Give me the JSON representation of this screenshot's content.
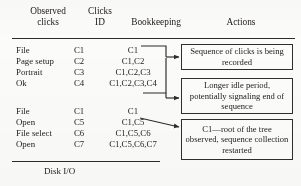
{
  "figure": {
    "caption_columns": {
      "observed_clicks": "Observed\nclicks",
      "clicks_id": "Clicks\nID",
      "bookkeeping": "Bookkeeping",
      "actions": "Actions"
    },
    "footer_label": "Disk I/O"
  },
  "rows": [
    {
      "observed": "File",
      "id": "C1",
      "bookkeeping": "C1"
    },
    {
      "observed": "Page setup",
      "id": "C2",
      "bookkeeping": "C1,C2"
    },
    {
      "observed": "Portrait",
      "id": "C3",
      "bookkeeping": "C1,C2,C3"
    },
    {
      "observed": "Ok",
      "id": "C4",
      "bookkeeping": "C1,C2,C3,C4"
    },
    {
      "observed": "File",
      "id": "C1",
      "bookkeeping": "C1"
    },
    {
      "observed": "Open",
      "id": "C5",
      "bookkeeping": "C1,C5"
    },
    {
      "observed": "File select",
      "id": "C6",
      "bookkeeping": "C1,C5,C6"
    },
    {
      "observed": "Open",
      "id": "C7",
      "bookkeeping": "C1,C5,C6,C7"
    }
  ],
  "actions": [
    {
      "text": "Sequence of clicks is being recorded"
    },
    {
      "text": "Longer idle period, potentially signaling end of sequence"
    },
    {
      "text": "C1—root of the tree observed, sequence collection restarted"
    }
  ],
  "colors": {
    "ink": "#1c1c1c",
    "rule": "#2b2b2b",
    "box_border": "#2e2e2e",
    "page": "#fbfbfa"
  }
}
